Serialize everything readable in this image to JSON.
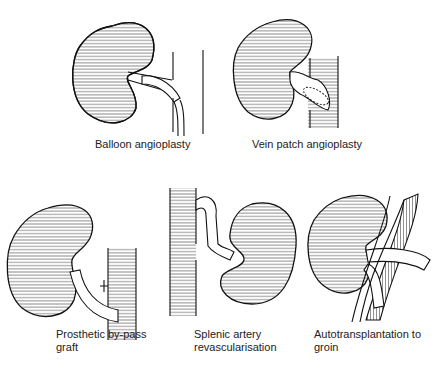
{
  "figure": {
    "panels": [
      {
        "id": "balloon",
        "caption": "Balloon angioplasty"
      },
      {
        "id": "vein-patch",
        "caption": "Vein patch angioplasty"
      },
      {
        "id": "prosthetic",
        "caption": "Prosthetic by-pass\ngraft"
      },
      {
        "id": "splenic",
        "caption": "Splenic artery\nrevascularisation"
      },
      {
        "id": "autotransplant",
        "caption": "Autotransplantation to\ngroin"
      }
    ]
  }
}
